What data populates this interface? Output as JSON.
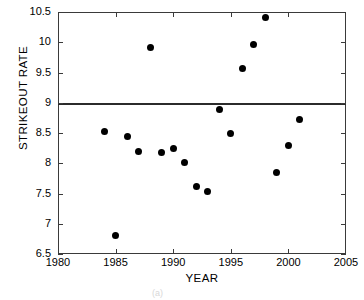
{
  "chart_data": {
    "type": "scatter",
    "title": "",
    "xlabel": "YEAR",
    "ylabel": "STRIKEOUT RATE",
    "xlim": [
      1980,
      2005
    ],
    "ylim": [
      6.5,
      10.5
    ],
    "xticks": [
      1980,
      1985,
      1990,
      1995,
      2000,
      2005
    ],
    "yticks": [
      6.5,
      7,
      7.5,
      8,
      8.5,
      9,
      9.5,
      10,
      10.5
    ],
    "xtick_labels": [
      "1980",
      "1985",
      "1990",
      "1995",
      "2000",
      "2005"
    ],
    "ytick_labels": [
      "6.5",
      "7",
      "7.5",
      "8",
      "8.5",
      "9",
      "9.5",
      "10",
      "10.5"
    ],
    "grid": false,
    "legend": null,
    "marker": "filled-circle",
    "marker_color": "#000000",
    "reference_lines": [
      {
        "name": "horizontal-reference-line",
        "axis": "y",
        "value": 9,
        "color": "#2b2b2b"
      }
    ],
    "x": [
      1984,
      1985,
      1986,
      1987,
      1988,
      1989,
      1990,
      1991,
      1992,
      1993,
      1994,
      1995,
      1996,
      1997,
      1998,
      1999,
      2000,
      2001
    ],
    "values": [
      8.52,
      6.8,
      8.44,
      8.2,
      9.92,
      8.18,
      8.25,
      8.01,
      7.61,
      7.54,
      8.89,
      8.49,
      9.56,
      9.96,
      10.41,
      7.85,
      8.3,
      8.72
    ],
    "points": [
      {
        "x": 1984,
        "y": 8.52
      },
      {
        "x": 1985,
        "y": 6.8
      },
      {
        "x": 1986,
        "y": 8.44
      },
      {
        "x": 1987,
        "y": 8.2
      },
      {
        "x": 1988,
        "y": 9.92
      },
      {
        "x": 1989,
        "y": 8.18
      },
      {
        "x": 1990,
        "y": 8.25
      },
      {
        "x": 1991,
        "y": 8.01
      },
      {
        "x": 1992,
        "y": 7.61
      },
      {
        "x": 1993,
        "y": 7.54
      },
      {
        "x": 1994,
        "y": 8.89
      },
      {
        "x": 1995,
        "y": 8.49
      },
      {
        "x": 1996,
        "y": 9.56
      },
      {
        "x": 1997,
        "y": 9.96
      },
      {
        "x": 1998,
        "y": 10.41
      },
      {
        "x": 1999,
        "y": 7.85
      },
      {
        "x": 2000,
        "y": 8.3
      },
      {
        "x": 2001,
        "y": 8.72
      }
    ]
  }
}
